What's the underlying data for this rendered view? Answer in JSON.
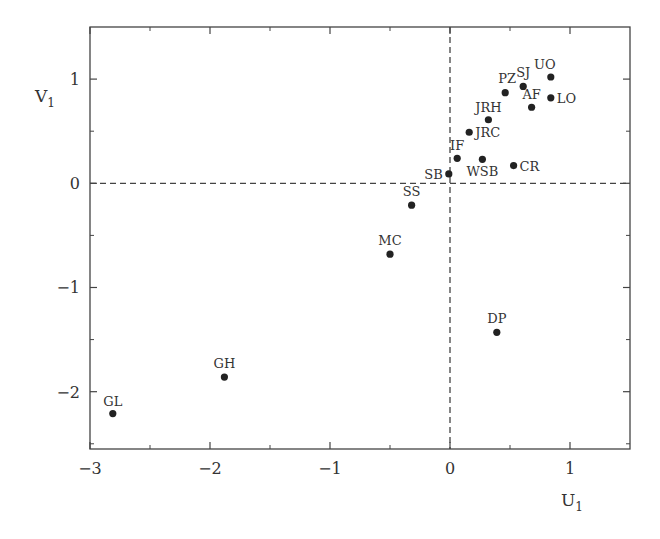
{
  "chart_data": {
    "type": "scatter",
    "title": "",
    "xlabel": "U",
    "xlabel_sub": "1",
    "ylabel": "V",
    "ylabel_sub": "1",
    "xlim": [
      -3,
      1.5
    ],
    "ylim": [
      -2.55,
      1.5
    ],
    "xticks": [
      -3,
      -2,
      -1,
      0,
      1
    ],
    "xtick_labels": [
      "−3",
      "−2",
      "−1",
      "0",
      "1"
    ],
    "xminor": [
      -2.5,
      -1.5,
      -0.5,
      0.5
    ],
    "yticks": [
      1,
      0,
      -1,
      -2
    ],
    "ytick_labels": [
      "1",
      "0",
      "−1",
      "−2"
    ],
    "yminor": [
      0.5,
      -0.5,
      -1.5,
      -2.5
    ],
    "grid": false,
    "reference_lines": {
      "x0_dashed": true,
      "y0_dashed": true
    },
    "legend": null,
    "points": [
      {
        "label": "UO",
        "x": 0.84,
        "y": 1.02,
        "lx": -6,
        "ly": -8,
        "anchor": "middle"
      },
      {
        "label": "SJ",
        "x": 0.61,
        "y": 0.93,
        "lx": 0,
        "ly": -9,
        "anchor": "middle"
      },
      {
        "label": "PZ",
        "x": 0.46,
        "y": 0.87,
        "lx": 2,
        "ly": -10,
        "anchor": "middle"
      },
      {
        "label": "AF",
        "x": 0.68,
        "y": 0.73,
        "lx": 0,
        "ly": -8,
        "anchor": "middle"
      },
      {
        "label": "LO",
        "x": 0.84,
        "y": 0.82,
        "lx": 6,
        "ly": 5,
        "anchor": "start"
      },
      {
        "label": "JRH",
        "x": 0.32,
        "y": 0.61,
        "lx": 0,
        "ly": -8,
        "anchor": "middle"
      },
      {
        "label": "JRC",
        "x": 0.16,
        "y": 0.49,
        "lx": 6,
        "ly": 5,
        "anchor": "start"
      },
      {
        "label": "IF",
        "x": 0.06,
        "y": 0.24,
        "lx": 0,
        "ly": -8,
        "anchor": "middle"
      },
      {
        "label": "WSB",
        "x": 0.27,
        "y": 0.23,
        "lx": 0,
        "ly": 17,
        "anchor": "middle"
      },
      {
        "label": "CR",
        "x": 0.53,
        "y": 0.17,
        "lx": 6,
        "ly": 5,
        "anchor": "start"
      },
      {
        "label": "SB",
        "x": -0.01,
        "y": 0.09,
        "lx": -6,
        "ly": 5,
        "anchor": "end"
      },
      {
        "label": "SS",
        "x": -0.32,
        "y": -0.21,
        "lx": 0,
        "ly": -9,
        "anchor": "middle"
      },
      {
        "label": "MC",
        "x": -0.5,
        "y": -0.68,
        "lx": 0,
        "ly": -9,
        "anchor": "middle"
      },
      {
        "label": "DP",
        "x": 0.39,
        "y": -1.43,
        "lx": 0,
        "ly": -9,
        "anchor": "middle"
      },
      {
        "label": "GH",
        "x": -1.88,
        "y": -1.86,
        "lx": 0,
        "ly": -9,
        "anchor": "middle"
      },
      {
        "label": "GL",
        "x": -2.81,
        "y": -2.21,
        "lx": 0,
        "ly": -8,
        "anchor": "middle"
      }
    ]
  },
  "colors": {
    "axis": "#444444",
    "points": "#222222",
    "text": "#333333",
    "background": "#ffffff"
  }
}
